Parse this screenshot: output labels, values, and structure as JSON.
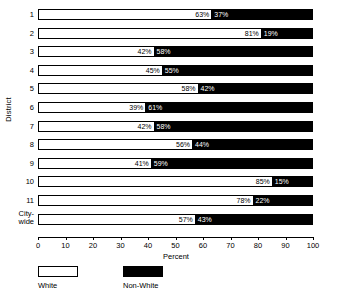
{
  "chart_data": {
    "type": "bar",
    "orientation": "horizontal",
    "stacked": true,
    "title": "",
    "xlabel": "Percent",
    "ylabel": "District",
    "xlim": [
      0,
      100
    ],
    "xticks": [
      0,
      10,
      20,
      30,
      40,
      50,
      60,
      70,
      80,
      90,
      100
    ],
    "grid": false,
    "legend_position": "bottom-left",
    "categories": [
      "1",
      "2",
      "3",
      "4",
      "5",
      "6",
      "7",
      "8",
      "9",
      "10",
      "11",
      "City-wide"
    ],
    "series": [
      {
        "name": "White",
        "color": "#ffffff",
        "values": [
          63,
          81,
          42,
          45,
          58,
          39,
          42,
          56,
          41,
          85,
          78,
          57
        ]
      },
      {
        "name": "Non-White",
        "color": "#000000",
        "values": [
          37,
          19,
          58,
          55,
          42,
          61,
          58,
          44,
          59,
          15,
          22,
          43
        ]
      }
    ],
    "data_labels": [
      {
        "category": "1",
        "white": "63%",
        "nonwhite": "37%"
      },
      {
        "category": "2",
        "white": "81%",
        "nonwhite": "19%"
      },
      {
        "category": "3",
        "white": "42%",
        "nonwhite": "58%"
      },
      {
        "category": "4",
        "white": "45%",
        "nonwhite": "55%"
      },
      {
        "category": "5",
        "white": "58%",
        "nonwhite": "42%"
      },
      {
        "category": "6",
        "white": "39%",
        "nonwhite": "61%"
      },
      {
        "category": "7",
        "white": "42%",
        "nonwhite": "58%"
      },
      {
        "category": "8",
        "white": "56%",
        "nonwhite": "44%"
      },
      {
        "category": "9",
        "white": "41%",
        "nonwhite": "59%"
      },
      {
        "category": "10",
        "white": "85%",
        "nonwhite": "15%"
      },
      {
        "category": "11",
        "white": "78%",
        "nonwhite": "22%"
      },
      {
        "category": "City-wide",
        "white": "57%",
        "nonwhite": "43%"
      }
    ],
    "y_tick_labels": [
      "1",
      "2",
      "3",
      "4",
      "5",
      "6",
      "7",
      "8",
      "9",
      "10",
      "11",
      "City-\nwide"
    ],
    "xtick_labels": [
      "0",
      "10",
      "20",
      "30",
      "40",
      "50",
      "60",
      "70",
      "80",
      "90",
      "100"
    ],
    "legend_entries": [
      {
        "label": "White",
        "swatch": "hollow"
      },
      {
        "label": "Non-White",
        "swatch": "filled"
      }
    ]
  },
  "axes": {
    "y_title": "District",
    "x_title": "Percent"
  },
  "legend": {
    "white_label": "White",
    "nonwhite_label": "Non-White"
  }
}
